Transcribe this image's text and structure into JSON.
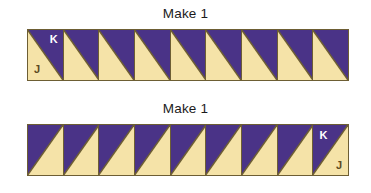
{
  "colors": {
    "purple": "#4a3387",
    "cream": "#f5e3a8",
    "outline": "#6d5e34",
    "background": "#ffffff",
    "label_k_text": "#ffffff",
    "label_j_text": "#5c4a22"
  },
  "units": [
    {
      "title": "Make 1",
      "block_count": 9,
      "orientation": "purple-upper-right",
      "labeled_block_index": 0,
      "labels": {
        "purple": "K",
        "cream": "J"
      }
    },
    {
      "title": "Make 1",
      "block_count": 9,
      "orientation": "purple-upper-left",
      "labeled_block_index": 8,
      "labels": {
        "purple": "K",
        "cream": "J"
      }
    }
  ]
}
